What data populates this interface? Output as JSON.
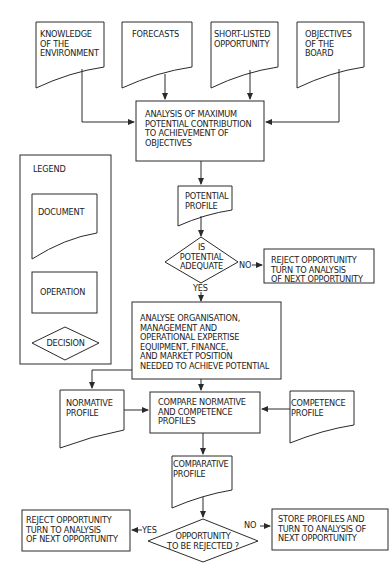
{
  "colors": {
    "stroke": "#2a2a2a",
    "text": "#222222",
    "background": "#ffffff"
  },
  "inputs": {
    "knowledge": "KNOWLEDGE\nOF THE\nENVIRONMENT",
    "forecasts": "FORECASTS",
    "short_listed": "SHORT-LISTED\nOPPORTUNITY",
    "objectives": "OBJECTIVES\nOF THE\nBOARD"
  },
  "analysis_box": "ANALYSIS OF MAXIMUM\nPOTENTIAL CONTRIBUTION\nTO ACHIEVEMENT OF\nOBJECTIVES",
  "potential_profile": "POTENTIAL\nPROFILE",
  "decision1": {
    "text": "IS\nPOTENTIAL\nADEQUATE",
    "no_label": "NO",
    "yes_label": "YES",
    "reject_text": "REJECT OPPORTUNITY\nTURN TO ANALYSIS\nOF NEXT OPPORTUNITY"
  },
  "analyse_box": "ANALYSE ORGANISATION,\nMANAGEMENT AND\nOPERATIONAL EXPERTISE\nEQUIPMENT, FINANCE,\nAND MARKET POSITION\nNEEDED TO ACHIEVE POTENTIAL",
  "normative_profile": "NORMATIVE\nPROFILE",
  "compare_box": "COMPARE NORMATIVE\nAND COMPETENCE\nPROFILES",
  "competence_profile": "COMPETENCE\nPROFILE",
  "comparative_profile": "COMPARATIVE\nPROFILE",
  "decision2": {
    "text": "OPPORTUNITY\nTO BE REJECTED ?",
    "yes_label": "YES",
    "no_label": "NO",
    "reject_text": "REJECT OPPORTUNITY\nTURN TO ANALYSIS\nOF NEXT OPPORTUNITY",
    "store_text": "STORE PROFILES AND\nTURN TO ANALYSIS OF\nNEXT OPPORTUNITY"
  },
  "legend": {
    "title": "LEGEND",
    "document": "DOCUMENT",
    "operation": "OPERATION",
    "decision": "DECISION"
  }
}
